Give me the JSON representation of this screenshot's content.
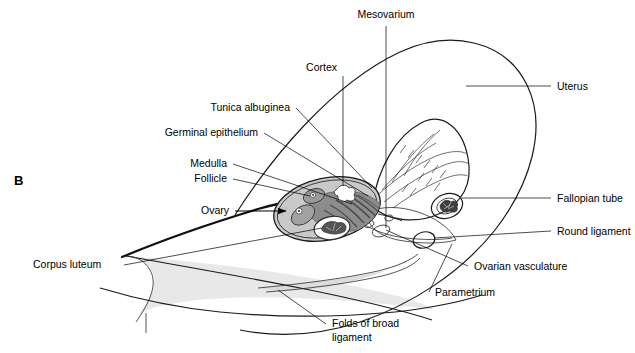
{
  "figure": {
    "panel_label": "B",
    "caption": "",
    "colors": {
      "ink": "#1a1a1a",
      "cortex_fill": "#c9c9c9",
      "medulla_fill": "#8d8d8d",
      "broad_ligament_fill": "#e6e6e6",
      "mesovarium_fill": "#d4d4d4",
      "follicle_fill": "#b0b0b0",
      "lumen_dark": "#4a4a4a",
      "white": "#ffffff"
    }
  },
  "labels": {
    "mesovarium": "Mesovarium",
    "cortex": "Cortex",
    "tunica_albuginea": "Tunica albuginea",
    "germinal_epithelium": "Germinal epithelium",
    "medulla": "Medulla",
    "follicle": "Follicle",
    "ovary": "Ovary",
    "corpus_luteum": "Corpus luteum",
    "uterus": "Uterus",
    "fallopian_tube": "Fallopian tube",
    "round_ligament": "Round ligament",
    "ovarian_vasculature": "Ovarian vasculature",
    "parametrium": "Parametrium",
    "folds_of_broad_ligament_line1": "Folds of broad",
    "folds_of_broad_ligament_line2": "ligament"
  }
}
